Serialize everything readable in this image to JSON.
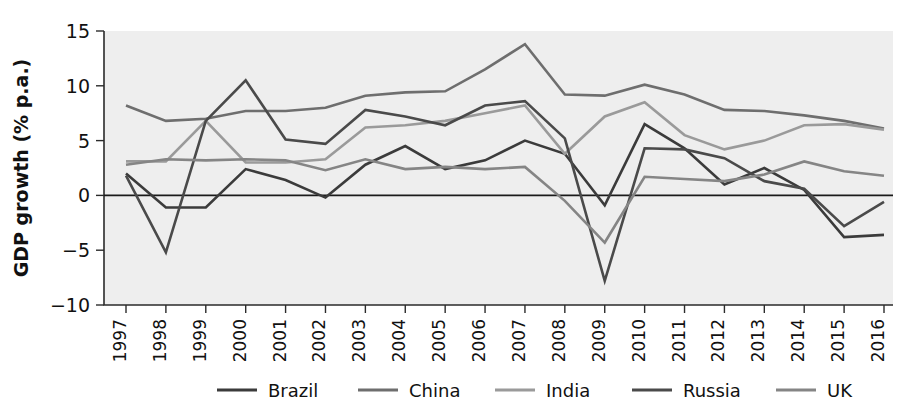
{
  "chart_data": {
    "type": "line",
    "title": "",
    "xlabel": "",
    "ylabel": "GDP growth (% p.a.)",
    "categories": [
      "1997",
      "1998",
      "1999",
      "2000",
      "2001",
      "2002",
      "2003",
      "2004",
      "2005",
      "2006",
      "2007",
      "2008",
      "2009",
      "2010",
      "2011",
      "2012",
      "2013",
      "2014",
      "2015",
      "2016"
    ],
    "x": [
      1997,
      1998,
      1999,
      2000,
      2001,
      2002,
      2003,
      2004,
      2005,
      2006,
      2007,
      2008,
      2009,
      2010,
      2011,
      2012,
      2013,
      2014,
      2015,
      2016
    ],
    "ylim": [
      -10,
      15
    ],
    "yticks": [
      -10,
      -5,
      0,
      5,
      10,
      15
    ],
    "ytick_labels": [
      "−10",
      "−5",
      "0",
      "5",
      "10",
      "15"
    ],
    "grid": false,
    "legend_position": "bottom",
    "series": [
      {
        "name": "Brazil",
        "color": "#3b3b3b",
        "values": [
          2.0,
          -1.1,
          -1.1,
          2.4,
          1.4,
          -0.2,
          2.8,
          4.5,
          2.4,
          3.2,
          5.0,
          3.8,
          -0.9,
          6.5,
          4.3,
          1.0,
          2.5,
          0.5,
          -3.8,
          -3.6
        ]
      },
      {
        "name": "China",
        "color": "#6e6e6e",
        "values": [
          8.2,
          6.8,
          7.0,
          7.7,
          7.7,
          8.0,
          9.1,
          9.4,
          9.5,
          11.5,
          13.8,
          9.2,
          9.1,
          10.1,
          9.2,
          7.8,
          7.7,
          7.3,
          6.8,
          6.1
        ]
      },
      {
        "name": "India",
        "color": "#9a9a9a",
        "values": [
          3.1,
          3.1,
          6.8,
          3.0,
          3.0,
          3.3,
          6.2,
          6.4,
          6.8,
          7.5,
          8.2,
          3.8,
          7.2,
          8.5,
          5.5,
          4.2,
          5.0,
          6.4,
          6.5,
          6.0
        ]
      },
      {
        "name": "Russia",
        "color": "#4a4a4a",
        "values": [
          1.8,
          -5.2,
          6.8,
          10.5,
          5.1,
          4.7,
          7.8,
          7.2,
          6.4,
          8.2,
          8.6,
          5.2,
          -7.8,
          4.3,
          4.2,
          3.4,
          1.3,
          0.6,
          -2.8,
          -0.6
        ]
      },
      {
        "name": "UK",
        "color": "#858585",
        "values": [
          2.8,
          3.3,
          3.2,
          3.3,
          3.2,
          2.3,
          3.3,
          2.4,
          2.6,
          2.4,
          2.6,
          -0.5,
          -4.3,
          1.7,
          1.5,
          1.3,
          1.9,
          3.1,
          2.2,
          1.8
        ]
      }
    ]
  },
  "axis": {
    "ylabel": "GDP growth (% p.a.)"
  },
  "legend": {
    "items": [
      {
        "label": "Brazil"
      },
      {
        "label": "China"
      },
      {
        "label": "India"
      },
      {
        "label": "Russia"
      },
      {
        "label": "UK"
      }
    ]
  }
}
